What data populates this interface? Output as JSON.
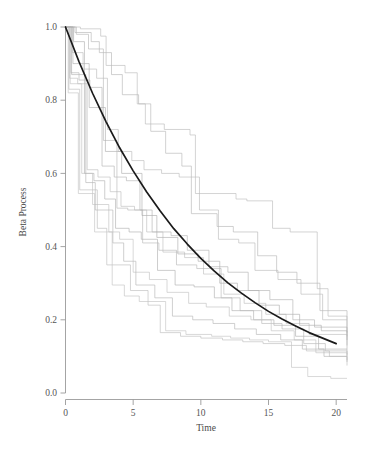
{
  "figure": {
    "background_color": "#ffffff",
    "width": 368,
    "height": 449
  },
  "chart_data": {
    "type": "line",
    "title": "",
    "subtitle": "",
    "xlabel": "Time",
    "ylabel": "Beta Process",
    "xlim": [
      0,
      20.8
    ],
    "ylim": [
      0.0,
      1.04
    ],
    "xticks": [
      0,
      5,
      10,
      15,
      20
    ],
    "xtick_labels": [
      "0",
      "5",
      "10",
      "15",
      "20"
    ],
    "yticks": [
      0.0,
      0.2,
      0.4,
      0.6,
      0.8,
      1.0
    ],
    "ytick_labels": [
      "0.0",
      "0.2",
      "0.4",
      "0.6",
      "0.8",
      "1.0"
    ],
    "grid": false,
    "legend": false,
    "legend_position": "none",
    "annotations": [],
    "colors": {
      "sample_path": "#b9b9b9",
      "mean_curve": "#1a1a1a",
      "axis": "#9a9a9a",
      "text": "#4a4a4a"
    },
    "mean_series": {
      "name": "Mean decay curve",
      "style": "solid-smooth",
      "color": "#1a1a1a",
      "description": "Exponential decay exp(-t/10) from 1.0 at t=0 to about 0.135 at t=20",
      "x": [
        0,
        1,
        2,
        3,
        4,
        5,
        6,
        7,
        8,
        9,
        10,
        11,
        12,
        13,
        14,
        15,
        16,
        17,
        18,
        19,
        20
      ],
      "y": [
        1.0,
        0.905,
        0.819,
        0.741,
        0.67,
        0.607,
        0.549,
        0.497,
        0.449,
        0.407,
        0.368,
        0.333,
        0.301,
        0.273,
        0.247,
        0.223,
        0.202,
        0.183,
        0.165,
        0.15,
        0.135
      ]
    },
    "sample_paths": [
      {
        "name": "path-1",
        "style": "step",
        "color": "#bcbcbc",
        "x": [
          0,
          1.1,
          2.6,
          3.0,
          4.4,
          5.3,
          5.9,
          7.3,
          9.2,
          9.6,
          12.6,
          13.4,
          15.3,
          16.6,
          18.6,
          19.4,
          20.8
        ],
        "y": [
          1.0,
          0.995,
          0.975,
          0.895,
          0.875,
          0.79,
          0.735,
          0.72,
          0.705,
          0.545,
          0.53,
          0.525,
          0.45,
          0.44,
          0.285,
          0.21,
          0.2
        ]
      },
      {
        "name": "path-2",
        "style": "step",
        "color": "#b8b8b8",
        "x": [
          0,
          0.7,
          1.9,
          2.5,
          3.4,
          4.2,
          5.4,
          6.3,
          7.4,
          8.6,
          9.3,
          11.2,
          12.4,
          14.2,
          15.6,
          17.1,
          18.8,
          20.8
        ],
        "y": [
          1.0,
          0.985,
          0.96,
          0.93,
          0.87,
          0.815,
          0.79,
          0.715,
          0.655,
          0.62,
          0.49,
          0.455,
          0.44,
          0.375,
          0.33,
          0.3,
          0.225,
          0.165
        ]
      },
      {
        "name": "path-3",
        "style": "step",
        "color": "#bdbdbd",
        "x": [
          0,
          0.5,
          1.3,
          2.3,
          3.1,
          3.9,
          4.9,
          5.8,
          7.1,
          8.4,
          9.9,
          11.3,
          12.8,
          14.0,
          15.7,
          17.4,
          19.0,
          20.8
        ],
        "y": [
          1.0,
          0.93,
          0.885,
          0.86,
          0.72,
          0.66,
          0.635,
          0.61,
          0.6,
          0.59,
          0.5,
          0.42,
          0.41,
          0.335,
          0.31,
          0.27,
          0.2,
          0.155
        ]
      },
      {
        "name": "path-4",
        "style": "step",
        "color": "#b5b5b5",
        "x": [
          0,
          0.4,
          1.0,
          1.8,
          2.7,
          3.6,
          4.5,
          5.5,
          6.4,
          7.8,
          9.0,
          10.6,
          12.0,
          13.5,
          15.1,
          16.8,
          18.4,
          20.8
        ],
        "y": [
          1.0,
          0.875,
          0.855,
          0.835,
          0.62,
          0.59,
          0.58,
          0.5,
          0.44,
          0.43,
          0.39,
          0.345,
          0.33,
          0.28,
          0.255,
          0.2,
          0.18,
          0.145
        ]
      },
      {
        "name": "path-5",
        "style": "step",
        "color": "#c0c0c0",
        "x": [
          0,
          0.3,
          0.9,
          1.6,
          2.4,
          3.3,
          4.1,
          5.1,
          6.0,
          7.2,
          8.8,
          10.2,
          11.7,
          13.2,
          14.8,
          16.3,
          18.0,
          20.8
        ],
        "y": [
          1.0,
          0.86,
          0.845,
          0.61,
          0.59,
          0.55,
          0.51,
          0.5,
          0.44,
          0.385,
          0.37,
          0.325,
          0.27,
          0.245,
          0.215,
          0.19,
          0.16,
          0.13
        ]
      },
      {
        "name": "path-6",
        "style": "step",
        "color": "#b2b2b2",
        "x": [
          0,
          0.6,
          1.4,
          2.1,
          2.9,
          3.7,
          4.7,
          5.6,
          6.8,
          8.1,
          9.5,
          11.0,
          12.3,
          13.9,
          15.4,
          17.0,
          18.7,
          20.8
        ],
        "y": [
          1.0,
          0.96,
          0.6,
          0.58,
          0.53,
          0.45,
          0.44,
          0.42,
          0.335,
          0.295,
          0.29,
          0.26,
          0.225,
          0.2,
          0.185,
          0.155,
          0.12,
          0.1
        ]
      },
      {
        "name": "path-7",
        "style": "step",
        "color": "#bababa",
        "x": [
          0,
          0.8,
          1.7,
          2.8,
          3.8,
          4.6,
          5.7,
          6.9,
          8.2,
          9.7,
          11.5,
          12.9,
          14.5,
          16.0,
          17.6,
          19.2,
          20.8
        ],
        "y": [
          1.0,
          0.98,
          0.94,
          0.69,
          0.505,
          0.5,
          0.41,
          0.39,
          0.35,
          0.34,
          0.26,
          0.225,
          0.19,
          0.175,
          0.135,
          0.115,
          0.105
        ]
      },
      {
        "name": "path-8",
        "style": "step",
        "color": "#c2c2c2",
        "x": [
          0,
          0.35,
          1.2,
          2.0,
          3.2,
          4.0,
          5.0,
          6.2,
          7.5,
          9.1,
          10.4,
          12.1,
          13.7,
          15.2,
          16.9,
          18.5,
          20.8
        ],
        "y": [
          1.0,
          0.845,
          0.6,
          0.515,
          0.44,
          0.42,
          0.33,
          0.31,
          0.275,
          0.245,
          0.235,
          0.21,
          0.2,
          0.17,
          0.145,
          0.11,
          0.09
        ]
      },
      {
        "name": "path-9",
        "style": "step",
        "color": "#b6b6b6",
        "x": [
          0,
          0.45,
          1.5,
          2.2,
          3.5,
          4.3,
          5.2,
          6.6,
          7.9,
          9.4,
          10.9,
          12.5,
          14.1,
          15.9,
          17.5,
          19.1,
          20.8
        ],
        "y": [
          1.0,
          0.87,
          0.575,
          0.5,
          0.41,
          0.36,
          0.295,
          0.26,
          0.21,
          0.2,
          0.19,
          0.175,
          0.16,
          0.145,
          0.12,
          0.1,
          0.085
        ]
      },
      {
        "name": "path-10",
        "style": "step",
        "color": "#bebebe",
        "x": [
          0,
          0.25,
          1.05,
          2.35,
          3.05,
          4.8,
          6.1,
          7.0,
          8.5,
          10.0,
          11.6,
          13.1,
          14.6,
          16.2,
          17.8,
          19.5,
          20.8
        ],
        "y": [
          1.0,
          0.83,
          0.555,
          0.45,
          0.35,
          0.28,
          0.24,
          0.165,
          0.155,
          0.15,
          0.145,
          0.14,
          0.135,
          0.13,
          0.115,
          0.1,
          0.075
        ]
      },
      {
        "name": "path-11",
        "style": "step",
        "color": "#c4c4c4",
        "x": [
          0,
          0.2,
          0.95,
          2.15,
          3.45,
          4.35,
          5.45,
          7.4,
          8.9,
          10.8,
          12.2,
          13.6,
          15.0,
          16.7,
          17.9,
          19.6,
          20.8
        ],
        "y": [
          1.0,
          0.82,
          0.545,
          0.44,
          0.295,
          0.265,
          0.25,
          0.17,
          0.16,
          0.155,
          0.15,
          0.145,
          0.14,
          0.07,
          0.045,
          0.04,
          0.04
        ]
      },
      {
        "name": "path-12",
        "style": "step",
        "color": "#b0b0b0",
        "x": [
          0,
          0.55,
          1.75,
          2.95,
          4.15,
          5.65,
          6.75,
          8.3,
          9.8,
          11.4,
          12.7,
          14.3,
          15.8,
          17.3,
          18.9,
          20.8
        ],
        "y": [
          1.0,
          0.9,
          0.78,
          0.66,
          0.6,
          0.485,
          0.425,
          0.38,
          0.36,
          0.3,
          0.28,
          0.24,
          0.215,
          0.185,
          0.17,
          0.12
        ]
      }
    ]
  }
}
